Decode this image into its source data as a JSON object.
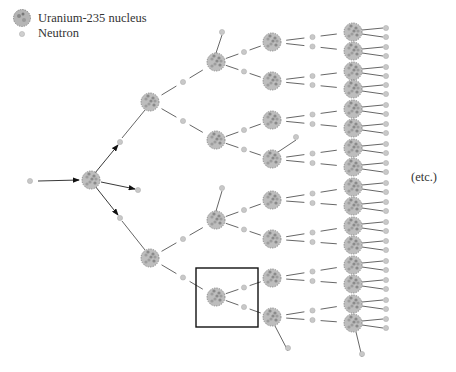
{
  "legend": {
    "items": [
      {
        "symbol": "nucleus",
        "label": "Uranium-235 nucleus"
      },
      {
        "symbol": "neutron",
        "label": "Neutron"
      }
    ]
  },
  "annotation": "(etc.)",
  "colors": {
    "nucleus": "#a8a8a8",
    "neutron": "#c8c8c8",
    "line": "#555555",
    "box": "#111111"
  },
  "chain": {
    "initial_neutron": [
      30,
      181
    ],
    "generations": [
      {
        "level": 0,
        "nuclei": [
          [
            91,
            180
          ]
        ]
      },
      {
        "level": 1,
        "nuclei": [
          [
            150,
            102
          ],
          [
            150,
            258
          ]
        ]
      },
      {
        "level": 2,
        "nuclei": [
          [
            216,
            62
          ],
          [
            216,
            140
          ],
          [
            216,
            220
          ],
          [
            216,
            297
          ]
        ]
      },
      {
        "level": 3,
        "nuclei": [
          [
            272,
            42
          ],
          [
            272,
            81
          ],
          [
            272,
            120
          ],
          [
            272,
            159
          ],
          [
            272,
            200
          ],
          [
            272,
            239
          ],
          [
            272,
            278
          ],
          [
            272,
            317
          ]
        ]
      },
      {
        "level": 4,
        "nuclei": [
          [
            353,
            32
          ],
          [
            353,
            51
          ],
          [
            353,
            71
          ],
          [
            353,
            89
          ],
          [
            353,
            109
          ],
          [
            353,
            128
          ],
          [
            353,
            148
          ],
          [
            353,
            167
          ],
          [
            353,
            187
          ],
          [
            353,
            206
          ],
          [
            353,
            226
          ],
          [
            353,
            245
          ],
          [
            353,
            265
          ],
          [
            353,
            284
          ],
          [
            353,
            304
          ],
          [
            353,
            323
          ]
        ]
      }
    ],
    "highlight_box": {
      "x": 196,
      "y": 268,
      "w": 62,
      "h": 59
    }
  }
}
